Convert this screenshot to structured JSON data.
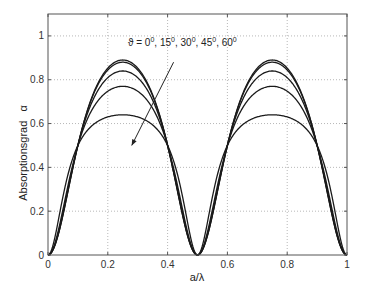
{
  "chart_data": {
    "type": "line",
    "title": "",
    "xlabel": "a/λ",
    "ylabel": "Absorptionsgrad   α",
    "xlim": [
      0,
      1
    ],
    "ylim": [
      0,
      1.1
    ],
    "xticks": [
      0,
      0.2,
      0.4,
      0.6,
      0.8,
      1
    ],
    "xtick_labels": [
      "0",
      "0.2",
      "0.4",
      "0.6",
      "0.8",
      "1"
    ],
    "yticks": [
      0,
      0.2,
      0.4,
      0.6,
      0.8,
      1
    ],
    "ytick_labels": [
      "0",
      "0.2",
      "0.4",
      "0.6",
      "0.8",
      "1"
    ],
    "grid": true,
    "legend": "none",
    "annotation": {
      "text_parts": [
        "ϑ = 0",
        "0",
        ",  15",
        "0",
        ",  30",
        "0",
        ",  45",
        "0",
        ",  60",
        "0"
      ],
      "text": "ϑ = 0°, 15°, 30°, 45°, 60°",
      "arrow_from": [
        0.42,
        0.88
      ],
      "arrow_to": [
        0.28,
        0.5
      ],
      "meaning": "arrow direction indicates increasing angle ϑ"
    },
    "x": [
      0,
      0.05,
      0.1,
      0.15,
      0.2,
      0.25,
      0.3,
      0.35,
      0.4,
      0.45,
      0.5,
      0.55,
      0.6,
      0.65,
      0.7,
      0.75,
      0.8,
      0.85,
      0.9,
      0.95,
      1.0
    ],
    "series": [
      {
        "name": "ϑ = 0°",
        "peak": 0.89,
        "shape_c": 0.411,
        "values": [
          0,
          0.18,
          0.5,
          0.73,
          0.85,
          0.89,
          0.85,
          0.73,
          0.5,
          0.18,
          0,
          0.18,
          0.5,
          0.73,
          0.85,
          0.89,
          0.85,
          0.73,
          0.5,
          0.18,
          0
        ]
      },
      {
        "name": "ϑ = 15°",
        "peak": 0.88,
        "shape_c": 0.4,
        "values": [
          0,
          0.19,
          0.5,
          0.72,
          0.84,
          0.88,
          0.84,
          0.72,
          0.5,
          0.19,
          0,
          0.19,
          0.5,
          0.72,
          0.84,
          0.88,
          0.84,
          0.72,
          0.5,
          0.19,
          0
        ]
      },
      {
        "name": "ϑ = 30°",
        "peak": 0.84,
        "shape_c": 0.358,
        "values": [
          0,
          0.2,
          0.5,
          0.7,
          0.81,
          0.84,
          0.81,
          0.7,
          0.5,
          0.2,
          0,
          0.2,
          0.5,
          0.7,
          0.81,
          0.84,
          0.81,
          0.7,
          0.5,
          0.2,
          0
        ]
      },
      {
        "name": "ϑ = 45°",
        "peak": 0.77,
        "shape_c": 0.285,
        "values": [
          0,
          0.22,
          0.5,
          0.67,
          0.75,
          0.77,
          0.75,
          0.67,
          0.5,
          0.22,
          0,
          0.22,
          0.5,
          0.67,
          0.75,
          0.77,
          0.75,
          0.67,
          0.5,
          0.22,
          0
        ]
      },
      {
        "name": "ϑ = 60°",
        "peak": 0.64,
        "shape_c": 0.148,
        "values": [
          0,
          0.27,
          0.5,
          0.59,
          0.63,
          0.64,
          0.63,
          0.59,
          0.5,
          0.27,
          0,
          0.27,
          0.5,
          0.59,
          0.63,
          0.64,
          0.63,
          0.59,
          0.5,
          0.27,
          0
        ]
      }
    ]
  },
  "style": {
    "line_color": "#1a1a1a",
    "axis_color": "#555555",
    "grid_color": "#9a9a9a",
    "background": "#ffffff"
  }
}
